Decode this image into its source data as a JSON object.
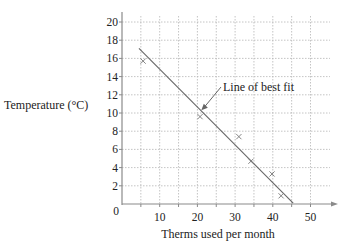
{
  "chart_data": {
    "type": "scatter",
    "title": "",
    "xlabel": "Therms used per month",
    "ylabel": "Temperature (°C)",
    "xlim": [
      0,
      55
    ],
    "ylim": [
      0,
      21
    ],
    "x_ticks": [
      0,
      10,
      20,
      30,
      40,
      50
    ],
    "y_ticks": [
      2,
      4,
      6,
      8,
      10,
      12,
      14,
      16,
      18,
      20
    ],
    "grid": true,
    "grid_x_step": 5,
    "grid_y_step": 2,
    "legend": "none",
    "series": [
      {
        "name": "Observations",
        "marker": "x",
        "points": [
          {
            "x": 5.6,
            "y": 15.7
          },
          {
            "x": 20.7,
            "y": 9.6
          },
          {
            "x": 31.0,
            "y": 7.4
          },
          {
            "x": 34.2,
            "y": 4.7
          },
          {
            "x": 39.8,
            "y": 3.3
          },
          {
            "x": 42.2,
            "y": 0.9
          }
        ]
      },
      {
        "name": "Line of best fit",
        "type": "line",
        "points": [
          {
            "x": 4.5,
            "y": 17.1
          },
          {
            "x": 45.4,
            "y": 0.1
          }
        ]
      }
    ],
    "annotations": [
      {
        "text": "Line of best fit",
        "arrow_to": {
          "x": 21.3,
          "y": 10.4
        }
      }
    ]
  },
  "labels": {
    "origin": "0",
    "annotation": "Line of best fit"
  },
  "colors": {
    "axis": "#8a8a8a",
    "grid": "#b5b5b5",
    "marker": "#777777",
    "line": "#666666",
    "text": "#222222"
  }
}
